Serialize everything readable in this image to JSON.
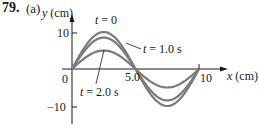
{
  "problem": {
    "number": "79.",
    "part": "(a)"
  },
  "chart_data": {
    "type": "line",
    "title": "",
    "xlabel": "x (cm)",
    "ylabel": "y (cm)",
    "xlim": [
      0,
      10.5
    ],
    "ylim": [
      -11,
      12
    ],
    "x_ticks": [
      "0",
      "5.0",
      "10"
    ],
    "y_ticks": [
      "10",
      "−10"
    ],
    "grid": false,
    "series": [
      {
        "name": "t = 0",
        "amplitude": 10,
        "wavelength": 10,
        "x": [
          0,
          2.5,
          5,
          7.5,
          10
        ],
        "values": [
          0,
          10,
          0,
          -10,
          0
        ]
      },
      {
        "name": "t = 1.0 s",
        "amplitude": 8.5,
        "wavelength": 10,
        "x": [
          0,
          2.5,
          5,
          7.5,
          10
        ],
        "values": [
          0,
          8.5,
          0,
          -8.5,
          0
        ]
      },
      {
        "name": "t = 2.0 s",
        "amplitude": 5,
        "wavelength": 10,
        "x": [
          0,
          2.5,
          5,
          7.5,
          10
        ],
        "values": [
          0,
          5,
          0,
          -5,
          0
        ]
      }
    ],
    "annotations": [
      "t = 0",
      "t = 1.0 s",
      "t = 2.0 s"
    ],
    "curve_color": "#7a7a7a",
    "axis_color": "#1a1a1a"
  }
}
